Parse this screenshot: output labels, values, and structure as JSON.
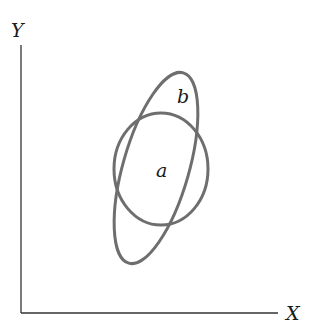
{
  "axes": {
    "x_label": "X",
    "y_label": "Y",
    "axis_color": "#333333"
  },
  "shapes": {
    "a": {
      "label": "a",
      "type": "circle",
      "stroke": "#6e6e6e"
    },
    "b": {
      "label": "b",
      "type": "ellipse",
      "stroke": "#6e6e6e"
    }
  }
}
